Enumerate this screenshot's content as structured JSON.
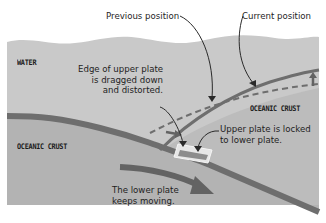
{
  "diagram": {
    "colors": {
      "background": "#ffffff",
      "water": "#c8c8c8",
      "crust_upper": "#bdbdbd",
      "crust_lower": "#b4b4b4",
      "plate_edge": "#6e6e6e",
      "arrow": "#636363",
      "locked_zone_fill": "#e6e6e6",
      "locked_zone_inner": "#8a8a8a",
      "callout_line": "#2a2a2a",
      "text": "#1e1e1e"
    },
    "zone_labels": {
      "water": "WATER",
      "oceanic_crust_left": "OCEANIC CRUST",
      "oceanic_crust_right": "OCEANIC CRUST"
    },
    "callouts": {
      "previous_position": "Previous position",
      "current_position": "Current position",
      "edge_dragged_line1": "Edge of upper plate",
      "edge_dragged_line2": "is dragged down",
      "edge_dragged_line3": "and distorted.",
      "locked_line1": "Upper plate is locked",
      "locked_line2": "to lower plate.",
      "lower_moving_line1": "The lower plate",
      "lower_moving_line2": "keeps moving."
    }
  }
}
